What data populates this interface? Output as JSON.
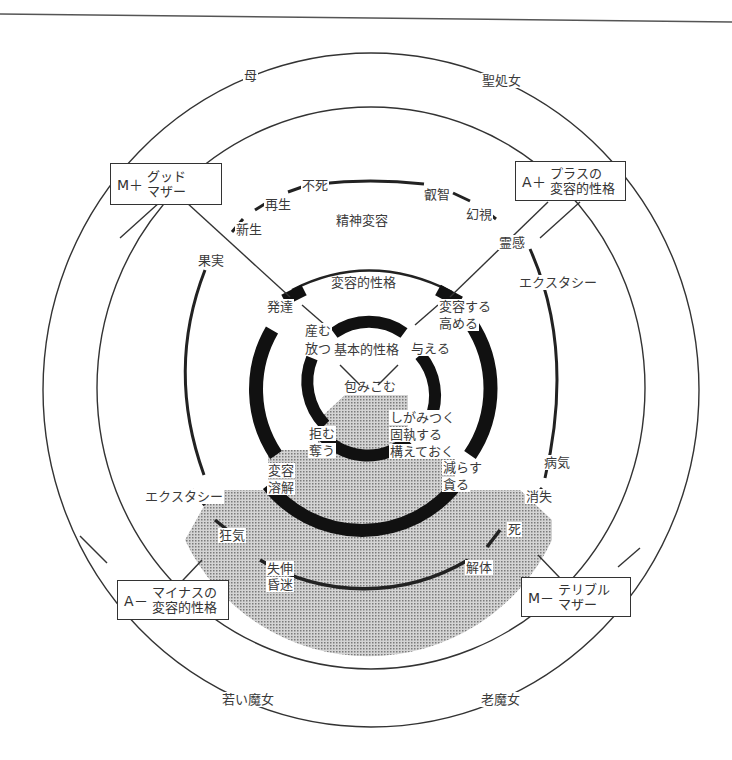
{
  "page": {
    "header_mark": ""
  },
  "diagram": {
    "title": "",
    "rings": [
      {
        "name": "outer",
        "style": "thin"
      },
      {
        "name": "second",
        "style": "thin"
      },
      {
        "name": "spirit-transformation",
        "style": "medium-broken"
      },
      {
        "name": "transformative-character",
        "style": "thick"
      },
      {
        "name": "elementary-character",
        "style": "thick"
      }
    ],
    "corner_boxes": {
      "top_left": {
        "symbol": "M＋",
        "lines": [
          "グッド",
          "マザー"
        ]
      },
      "top_right": {
        "symbol": "A＋",
        "lines": [
          "プラスの",
          "変容的性格"
        ]
      },
      "bottom_left": {
        "symbol": "A－",
        "lines": [
          "マイナスの",
          "変容的性格"
        ]
      },
      "bottom_right": {
        "symbol": "M－",
        "lines": [
          "テリブル",
          "マザー"
        ]
      }
    },
    "outer_ring_labels": {
      "mother": "母",
      "holy_virgin": "聖処女",
      "young_witch": "若い魔女",
      "old_witch": "老魔女"
    },
    "third_ring_labels": {
      "immortality": "不死",
      "rebirth": "再生",
      "new_birth": "新生",
      "fruit": "果実",
      "wisdom": "叡智",
      "vision": "幻視",
      "inspiration": "霊感",
      "ecstasy_right": "エクスタシー",
      "ecstasy_left": "エクスタシー",
      "illness": "病気",
      "disappearance": "消失",
      "death": "死",
      "madness": "狂気",
      "dissolution": "解体",
      "stupor_1": "失伸",
      "stupor_2": "昏迷",
      "zone_title": "精神変容"
    },
    "mid_ring_labels": {
      "zone_title": "変容的性格",
      "development": "発達",
      "transform_1": "変容する",
      "transform_2": "高める",
      "change_1": "変容",
      "change_2": "溶解",
      "reduce_1": "減らす",
      "reduce_2": "貪る"
    },
    "inner_ring_labels": {
      "zone_title": "基本的性格",
      "bear_1": "産む",
      "bear_2": "放つ",
      "give": "与える",
      "contain": "包みこむ",
      "refuse_1": "拒む",
      "refuse_2": "奪う",
      "cling_1": "しがみつく",
      "cling_2": "固執する",
      "cling_3": "構えておく"
    },
    "colors": {
      "line": "#333333",
      "shade": "#b4b4b4",
      "background": "#ffffff"
    }
  }
}
